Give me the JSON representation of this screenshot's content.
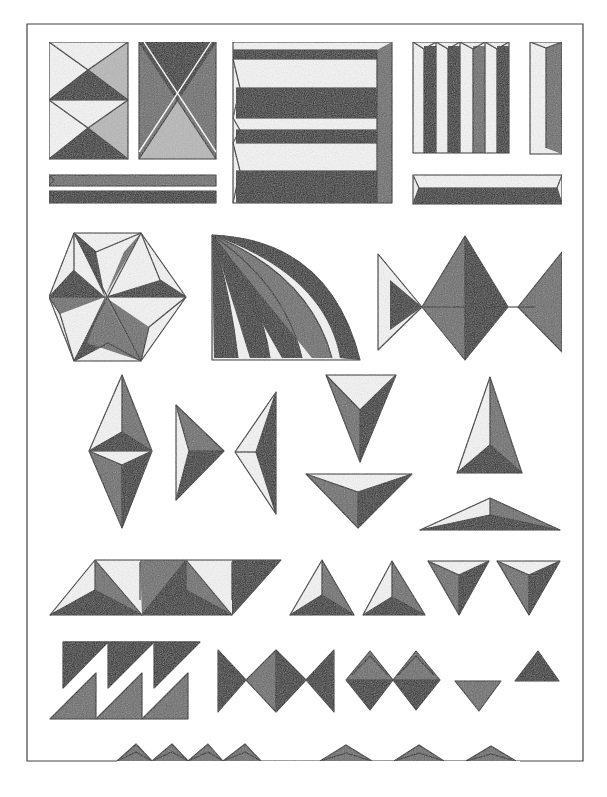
{
  "plate": {
    "title": "Chip-carving ornament patterns",
    "description": "Illustrated plate of faceted, shaded geometric carving motifs: squares, bars, hexagon star, fan, bow-tie diamonds, triangles, zigzag and serrated border.",
    "colors": {
      "background": "#ffffff",
      "ink": "#1a1a1a",
      "shade_dark": "#2a2a2a",
      "shade_mid": "#6a6a6a",
      "shade_light": "#b8b8b8",
      "frame": "#444444"
    },
    "frame": {
      "x": 27,
      "y": 24,
      "width": 556,
      "height": 737
    },
    "rows": [
      {
        "name": "row-1",
        "motifs": [
          "square-hourglass",
          "square-x-pyramid",
          "framed-panel-bars",
          "vertical-fluted-block",
          "single-vertical-bar",
          "double-horizontal-bars",
          "horizontal-bar"
        ]
      },
      {
        "name": "row-2",
        "motifs": [
          "hexagon-star",
          "quarter-fan",
          "bowtie-diamonds"
        ]
      },
      {
        "name": "row-3",
        "motifs": [
          "vertical-double-diamond",
          "right-triangle-pair",
          "inverted-triangle",
          "flat-inverted-triangle",
          "tall-triangle",
          "flat-triangle"
        ]
      },
      {
        "name": "row-4",
        "motifs": [
          "parallelogram-triangle-band",
          "upward-triangle-pair",
          "downward-triangle-pair"
        ]
      },
      {
        "name": "row-5",
        "motifs": [
          "sawtooth-zigzag",
          "bowtie-band",
          "diamond-pair",
          "small-down-triangle",
          "small-up-triangle"
        ]
      },
      {
        "name": "row-6",
        "motifs": [
          "serrated-border-edge"
        ]
      }
    ]
  }
}
